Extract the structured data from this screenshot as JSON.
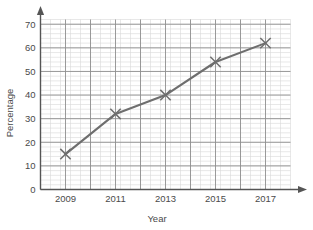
{
  "chart_data": {
    "type": "line",
    "title": "",
    "xlabel": "Year",
    "ylabel": "Percentage",
    "x": [
      2009,
      2011,
      2013,
      2015,
      2017
    ],
    "values": [
      15,
      32,
      40,
      54,
      62
    ],
    "series": [
      {
        "name": "Percentage",
        "values": [
          15,
          32,
          40,
          54,
          62
        ]
      }
    ],
    "xlim": [
      2008,
      2018
    ],
    "ylim": [
      0,
      72
    ],
    "xticks": [
      2009,
      2011,
      2013,
      2015,
      2017
    ],
    "xtick_labels": [
      "2009",
      "2011",
      "2013",
      "2015",
      "2017"
    ],
    "yticks": [
      0,
      10,
      20,
      30,
      40,
      50,
      60,
      70
    ],
    "ytick_labels": [
      "0",
      "10",
      "20",
      "30",
      "40",
      "50",
      "60",
      "70"
    ],
    "grid": true,
    "minor_grid": true,
    "minor_grid_step_y": 2,
    "minor_grid_step_x": 0.4,
    "legend": "none",
    "marker": "x",
    "line_color": "#6e6e6e",
    "marker_color": "#6e6e6e",
    "major_grid_color": "#8f8f8f",
    "minor_grid_color": "#d8d8d8",
    "axis_color": "#555555",
    "background_color": "#ffffff",
    "axis_arrows": [
      "x-right",
      "y-up"
    ]
  }
}
